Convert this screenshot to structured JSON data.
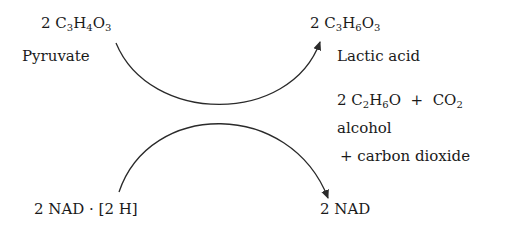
{
  "diagram": {
    "type": "coupled-reaction-crossing-arrows",
    "reactant_top": {
      "coefficient": "2",
      "formula_parts": [
        "C",
        "3",
        "H",
        "4",
        "O",
        "3"
      ],
      "name": "Pyruvate"
    },
    "product_top": {
      "coefficient": "2",
      "formula_parts": [
        "C",
        "3",
        "H",
        "6",
        "O",
        "3"
      ],
      "name": "Lactic acid"
    },
    "product_alt": {
      "coefficient": "2",
      "formula_parts": [
        "C",
        "2",
        "H",
        "6",
        "O"
      ],
      "plus": "+",
      "co2_parts": [
        "CO",
        "2"
      ],
      "name_line1": "alcohol",
      "name_line2": "+ carbon dioxide"
    },
    "reactant_bottom": {
      "label": "2 NAD · [2 H]"
    },
    "product_bottom": {
      "label": "2 NAD"
    },
    "colors": {
      "line": "#2a2a2a",
      "text": "#1a1a1a",
      "background": "#ffffff"
    }
  }
}
